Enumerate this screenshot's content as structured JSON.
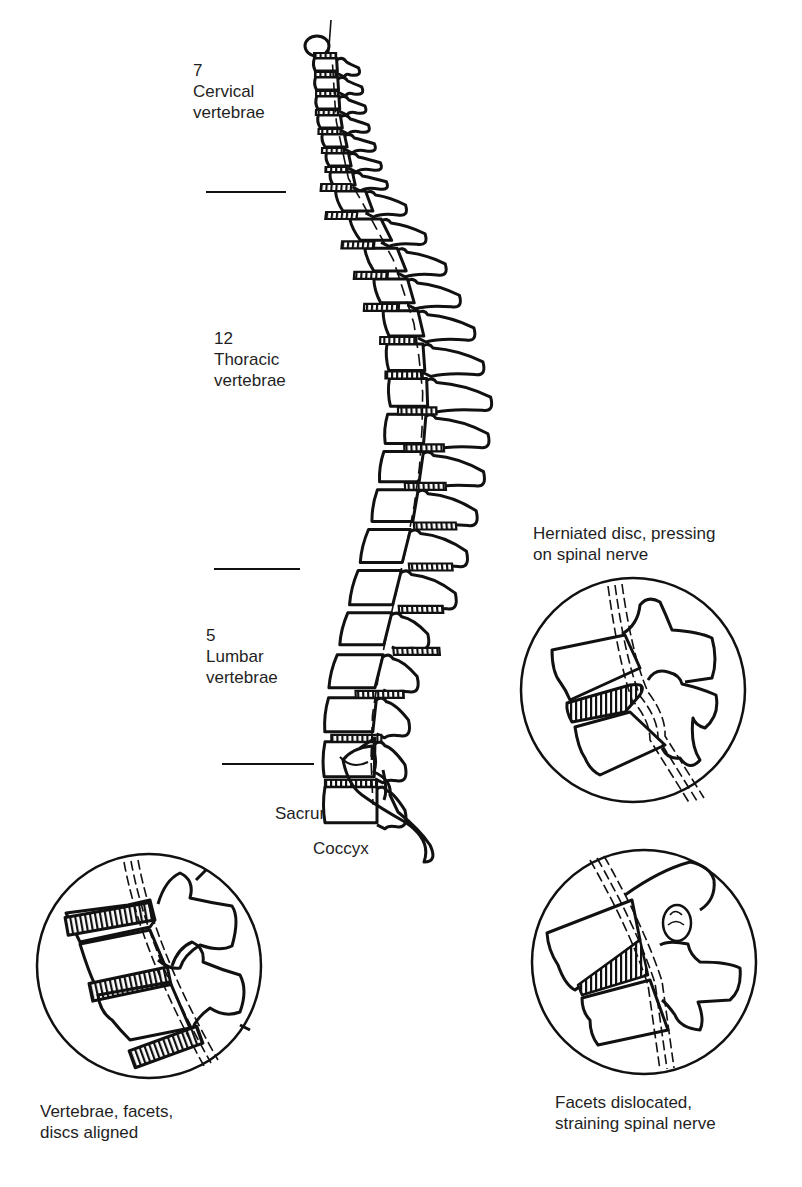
{
  "figure": {
    "regions": [
      {
        "id": "cervical",
        "count": "7",
        "name": "Cervical",
        "suffix": "vertebrae"
      },
      {
        "id": "thoracic",
        "count": "12",
        "name": "Thoracic",
        "suffix": "vertebrae"
      },
      {
        "id": "lumbar",
        "count": "5",
        "name": "Lumbar",
        "suffix": "vertebrae"
      }
    ],
    "sacrum_label": "Sacrum",
    "coccyx_label": "Coccyx",
    "insets": [
      {
        "id": "aligned",
        "caption_line1": "Vertebrae, facets,",
        "caption_line2": "discs aligned"
      },
      {
        "id": "herniated",
        "caption_line1": "Herniated disc, pressing",
        "caption_line2": "on spinal nerve"
      },
      {
        "id": "dislocated",
        "caption_line1": "Facets dislocated,",
        "caption_line2": "straining spinal nerve"
      }
    ],
    "line_color": "#111111",
    "background": "#ffffff"
  }
}
